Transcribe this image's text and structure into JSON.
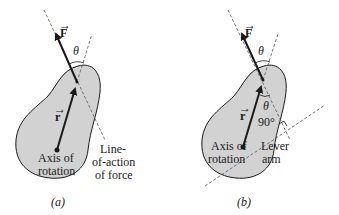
{
  "figure": {
    "panel_a": {
      "caption": "(a)",
      "force_label": "F",
      "radius_label": "r",
      "angle_label": "θ",
      "axis_label_line1": "Axis of",
      "axis_label_line2": "rotation",
      "line_of_action_line1": "Line-",
      "line_of_action_line2": "of-action",
      "line_of_action_line3": "of force"
    },
    "panel_b": {
      "caption": "(b)",
      "force_label": "F",
      "radius_label": "r",
      "angle_label_top": "θ",
      "angle_label_inner": "θ",
      "right_angle_label": "90°",
      "axis_label_line1": "Axis of",
      "axis_label_line2": "rotation",
      "lever_label_line1": "Lever",
      "lever_label_line2": "arm"
    },
    "colors": {
      "body_fill": "#d2d2d2",
      "outline": "#1a1a1a",
      "dashed": "#555555"
    }
  }
}
